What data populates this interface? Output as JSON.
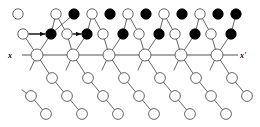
{
  "figure": {
    "title": "",
    "type": "molecular-lattice-diagram",
    "width": 260,
    "height": 127,
    "background_color": "#ffffff"
  },
  "axis": {
    "label_left": "x",
    "label_right": "x'",
    "label_left_pos": {
      "x": 10,
      "y": 55
    },
    "label_right_pos": {
      "x": 243,
      "y": 55
    },
    "line_y": 55,
    "line_x_start": 22,
    "line_x_end": 238,
    "color": "#555555"
  },
  "legend_semantics": {
    "open_circle": "unfilled-atom-site",
    "filled_circle": "filled-atom-site",
    "arrow": "displacement-vector"
  },
  "colors": {
    "stroke": "#555555",
    "open_fill": "#ffffff",
    "filled_fill": "#000000",
    "text": "#000000"
  },
  "geometry": {
    "radius_main": 6.0,
    "radius_small": 5.2,
    "radius_chain": 5.4
  },
  "main_chain_nodes": [
    {
      "id": "m1",
      "x": 37,
      "y": 55,
      "fill": "open"
    },
    {
      "id": "m2",
      "x": 73,
      "y": 55,
      "fill": "open"
    },
    {
      "id": "m3",
      "x": 109,
      "y": 55,
      "fill": "open"
    },
    {
      "id": "m4",
      "x": 145,
      "y": 55,
      "fill": "open"
    },
    {
      "id": "m5",
      "x": 181,
      "y": 55,
      "fill": "open"
    },
    {
      "id": "m6",
      "x": 217,
      "y": 55,
      "fill": "open"
    }
  ],
  "upper_mid_nodes": [
    {
      "id": "u0",
      "x": 23,
      "y": 34,
      "fill": "open"
    },
    {
      "id": "u1",
      "x": 51,
      "y": 34,
      "fill": "filled"
    },
    {
      "id": "u2",
      "x": 67,
      "y": 34,
      "fill": "open"
    },
    {
      "id": "u3",
      "x": 87,
      "y": 34,
      "fill": "filled"
    },
    {
      "id": "u4",
      "x": 103,
      "y": 34,
      "fill": "open"
    },
    {
      "id": "u5",
      "x": 123,
      "y": 34,
      "fill": "filled"
    },
    {
      "id": "u6",
      "x": 139,
      "y": 34,
      "fill": "open"
    },
    {
      "id": "u7",
      "x": 159,
      "y": 34,
      "fill": "filled"
    },
    {
      "id": "u8",
      "x": 175,
      "y": 34,
      "fill": "open"
    },
    {
      "id": "u9",
      "x": 195,
      "y": 34,
      "fill": "filled"
    },
    {
      "id": "u10",
      "x": 211,
      "y": 34,
      "fill": "open"
    },
    {
      "id": "u11",
      "x": 231,
      "y": 34,
      "fill": "filled"
    }
  ],
  "top_nodes": [
    {
      "id": "t0",
      "x": 18,
      "y": 14,
      "fill": "open"
    },
    {
      "id": "t1",
      "x": 56,
      "y": 14,
      "fill": "open"
    },
    {
      "id": "t2",
      "x": 74,
      "y": 14,
      "fill": "filled"
    },
    {
      "id": "t3",
      "x": 92,
      "y": 14,
      "fill": "open"
    },
    {
      "id": "t4",
      "x": 110,
      "y": 14,
      "fill": "filled"
    },
    {
      "id": "t5",
      "x": 128,
      "y": 14,
      "fill": "open"
    },
    {
      "id": "t6",
      "x": 146,
      "y": 14,
      "fill": "filled"
    },
    {
      "id": "t7",
      "x": 164,
      "y": 14,
      "fill": "open"
    },
    {
      "id": "t8",
      "x": 182,
      "y": 14,
      "fill": "filled"
    },
    {
      "id": "t9",
      "x": 200,
      "y": 14,
      "fill": "open"
    },
    {
      "id": "t10",
      "x": 218,
      "y": 14,
      "fill": "filled"
    },
    {
      "id": "t11",
      "x": 236,
      "y": 14,
      "fill": "filled"
    }
  ],
  "chain_nodes": [
    {
      "id": "c1a",
      "x": 52,
      "y": 78,
      "fill": "open"
    },
    {
      "id": "c1b",
      "x": 67,
      "y": 96,
      "fill": "open"
    },
    {
      "id": "c1c",
      "x": 82,
      "y": 114,
      "fill": "open"
    },
    {
      "id": "c2a",
      "x": 88,
      "y": 78,
      "fill": "open"
    },
    {
      "id": "c2b",
      "x": 103,
      "y": 96,
      "fill": "open"
    },
    {
      "id": "c2c",
      "x": 118,
      "y": 114,
      "fill": "open"
    },
    {
      "id": "c3a",
      "x": 124,
      "y": 78,
      "fill": "open"
    },
    {
      "id": "c3b",
      "x": 139,
      "y": 96,
      "fill": "open"
    },
    {
      "id": "c3c",
      "x": 154,
      "y": 114,
      "fill": "open"
    },
    {
      "id": "c4a",
      "x": 160,
      "y": 78,
      "fill": "open"
    },
    {
      "id": "c4b",
      "x": 175,
      "y": 96,
      "fill": "open"
    },
    {
      "id": "c4c",
      "x": 190,
      "y": 114,
      "fill": "open"
    },
    {
      "id": "c5a",
      "x": 196,
      "y": 78,
      "fill": "open"
    },
    {
      "id": "c5b",
      "x": 211,
      "y": 96,
      "fill": "open"
    },
    {
      "id": "c5c",
      "x": 226,
      "y": 114,
      "fill": "open"
    },
    {
      "id": "c6a",
      "x": 232,
      "y": 78,
      "fill": "open"
    },
    {
      "id": "c6b",
      "x": 247,
      "y": 96,
      "fill": "open"
    },
    {
      "id": "c0b",
      "x": 31,
      "y": 96,
      "fill": "open"
    },
    {
      "id": "c0c",
      "x": 46,
      "y": 114,
      "fill": "open"
    }
  ],
  "bonds": [
    {
      "from": [
        37,
        55
      ],
      "to": [
        51,
        34
      ]
    },
    {
      "from": [
        37,
        55
      ],
      "to": [
        23,
        34
      ]
    },
    {
      "from": [
        23,
        34
      ],
      "to": [
        51,
        34
      ]
    },
    {
      "from": [
        51,
        34
      ],
      "to": [
        56,
        14
      ]
    },
    {
      "from": [
        51,
        34
      ],
      "to": [
        74,
        14
      ]
    },
    {
      "from": [
        67,
        34
      ],
      "to": [
        56,
        14
      ]
    },
    {
      "from": [
        67,
        34
      ],
      "to": [
        73,
        55
      ]
    },
    {
      "from": [
        73,
        55
      ],
      "to": [
        87,
        34
      ]
    },
    {
      "from": [
        67,
        34
      ],
      "to": [
        87,
        34
      ]
    },
    {
      "from": [
        87,
        34
      ],
      "to": [
        92,
        14
      ]
    },
    {
      "from": [
        103,
        34
      ],
      "to": [
        92,
        14
      ]
    },
    {
      "from": [
        103,
        34
      ],
      "to": [
        109,
        55
      ]
    },
    {
      "from": [
        109,
        55
      ],
      "to": [
        123,
        34
      ]
    },
    {
      "from": [
        123,
        34
      ],
      "to": [
        128,
        14
      ]
    },
    {
      "from": [
        139,
        34
      ],
      "to": [
        128,
        14
      ]
    },
    {
      "from": [
        139,
        34
      ],
      "to": [
        145,
        55
      ]
    },
    {
      "from": [
        145,
        55
      ],
      "to": [
        159,
        34
      ]
    },
    {
      "from": [
        159,
        34
      ],
      "to": [
        164,
        14
      ]
    },
    {
      "from": [
        175,
        34
      ],
      "to": [
        164,
        14
      ]
    },
    {
      "from": [
        175,
        34
      ],
      "to": [
        181,
        55
      ]
    },
    {
      "from": [
        181,
        55
      ],
      "to": [
        195,
        34
      ]
    },
    {
      "from": [
        195,
        34
      ],
      "to": [
        200,
        14
      ]
    },
    {
      "from": [
        211,
        34
      ],
      "to": [
        200,
        14
      ]
    },
    {
      "from": [
        211,
        34
      ],
      "to": [
        217,
        55
      ]
    },
    {
      "from": [
        217,
        55
      ],
      "to": [
        231,
        34
      ]
    },
    {
      "from": [
        231,
        34
      ],
      "to": [
        236,
        14
      ]
    },
    {
      "from": [
        37,
        55
      ],
      "to": [
        52,
        78
      ]
    },
    {
      "from": [
        52,
        78
      ],
      "to": [
        67,
        96
      ]
    },
    {
      "from": [
        67,
        96
      ],
      "to": [
        82,
        114
      ]
    },
    {
      "from": [
        73,
        55
      ],
      "to": [
        88,
        78
      ]
    },
    {
      "from": [
        88,
        78
      ],
      "to": [
        103,
        96
      ]
    },
    {
      "from": [
        103,
        96
      ],
      "to": [
        118,
        114
      ]
    },
    {
      "from": [
        109,
        55
      ],
      "to": [
        124,
        78
      ]
    },
    {
      "from": [
        124,
        78
      ],
      "to": [
        139,
        96
      ]
    },
    {
      "from": [
        139,
        96
      ],
      "to": [
        154,
        114
      ]
    },
    {
      "from": [
        145,
        55
      ],
      "to": [
        160,
        78
      ]
    },
    {
      "from": [
        160,
        78
      ],
      "to": [
        175,
        96
      ]
    },
    {
      "from": [
        175,
        96
      ],
      "to": [
        190,
        114
      ]
    },
    {
      "from": [
        181,
        55
      ],
      "to": [
        196,
        78
      ]
    },
    {
      "from": [
        196,
        78
      ],
      "to": [
        211,
        96
      ]
    },
    {
      "from": [
        211,
        96
      ],
      "to": [
        226,
        114
      ]
    },
    {
      "from": [
        217,
        55
      ],
      "to": [
        232,
        78
      ]
    },
    {
      "from": [
        232,
        78
      ],
      "to": [
        247,
        96
      ]
    },
    {
      "from": [
        37,
        55
      ],
      "to": [
        30,
        70
      ]
    },
    {
      "from": [
        73,
        55
      ],
      "to": [
        66,
        70
      ]
    },
    {
      "from": [
        109,
        55
      ],
      "to": [
        102,
        70
      ]
    },
    {
      "from": [
        145,
        55
      ],
      "to": [
        138,
        70
      ]
    },
    {
      "from": [
        181,
        55
      ],
      "to": [
        174,
        70
      ]
    },
    {
      "from": [
        217,
        55
      ],
      "to": [
        210,
        70
      ]
    },
    {
      "from": [
        22,
        90
      ],
      "to": [
        31,
        96
      ]
    },
    {
      "from": [
        31,
        96
      ],
      "to": [
        46,
        114
      ]
    }
  ],
  "arrows": [
    {
      "from": [
        29,
        34
      ],
      "to": [
        45,
        34
      ]
    },
    {
      "from": [
        73,
        34
      ],
      "to": [
        81,
        34
      ]
    }
  ]
}
